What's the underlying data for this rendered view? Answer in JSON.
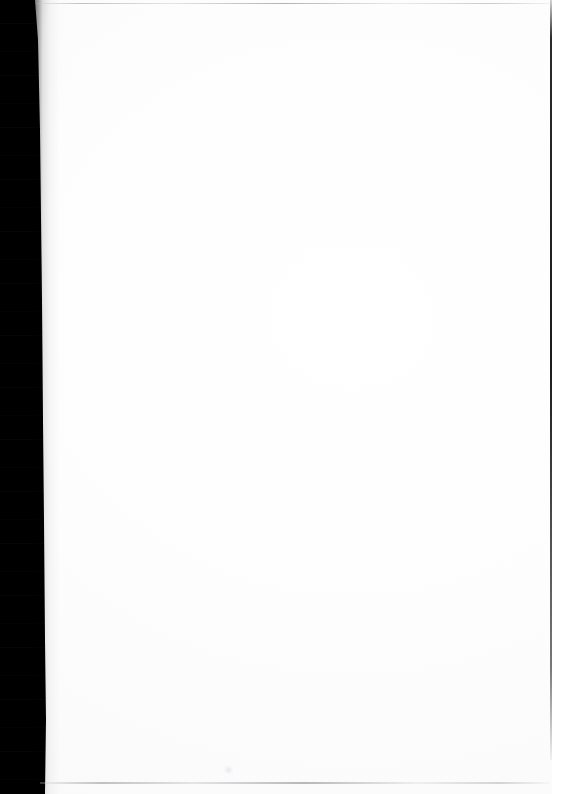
{
  "document": {
    "kind": "scanned-page",
    "page_state": "blank",
    "visible_text": "",
    "body_text_lines": [],
    "page_number": "",
    "header_text": "",
    "footer_text": ""
  },
  "canvas": {
    "width_px": 562,
    "height_px": 794,
    "page_background": "#ffffff",
    "paper_tone": "#fdfdfd"
  },
  "artifacts": {
    "left_gutter": {
      "label": "scanner gutter shadow",
      "color": "#000000",
      "left_px": 0,
      "top_px": 0,
      "width_px": 46,
      "height_px": 794,
      "edge_profile": "slightly slanted, narrower at top"
    },
    "gutter_falloff": {
      "label": "gutter shadow falloff",
      "color": "#000000",
      "left_px": 34,
      "width_px": 26
    },
    "right_edge_rule": {
      "label": "right margin dark rule",
      "color": "#19191c",
      "left_px": 550,
      "top_px": 0,
      "width_px": 2,
      "height_px": 760
    },
    "top_edge_rule": {
      "label": "top edge gray line",
      "color": "#b0b1b5",
      "left_px": 36,
      "top_px": 3,
      "width_px": 516,
      "height_px": 1
    },
    "bottom_edge_rule": {
      "label": "bottom edge gray line",
      "color": "#a8a9ae",
      "left_px": 40,
      "bottom_px": 10,
      "width_px": 510,
      "height_px": 2
    },
    "scan_speck": {
      "label": "faint residual scan speck",
      "color": "#e2e3e7",
      "left_px": 224,
      "top_px": 766,
      "width_px": 9,
      "height_px": 8
    }
  }
}
